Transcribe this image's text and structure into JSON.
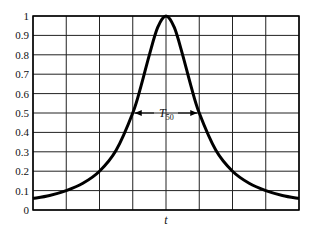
{
  "chart_data": {
    "type": "line",
    "title": "",
    "xlabel": "t",
    "ylabel": "",
    "xlim": [
      -4,
      4
    ],
    "ylim": [
      0,
      1
    ],
    "x_grid_divisions": 8,
    "yticks": [
      0,
      0.1,
      0.2,
      0.3,
      0.4,
      0.5,
      0.6,
      0.7,
      0.8,
      0.9,
      1
    ],
    "ytick_labels": [
      "0",
      "0.1",
      "0.2",
      "0.3",
      "0.4",
      "0.5",
      "0.6",
      "0.7",
      "0.8",
      "0.9",
      "1"
    ],
    "xtick_labels": [],
    "grid": true,
    "series": [
      {
        "name": "response",
        "x": [
          -4,
          -3.5,
          -3,
          -2.5,
          -2,
          -1.5,
          -1,
          -0.75,
          -0.5,
          -0.25,
          0,
          0.25,
          0.5,
          0.75,
          1,
          1.5,
          2,
          2.5,
          3,
          3.5,
          4
        ],
        "y": [
          0.059,
          0.075,
          0.1,
          0.138,
          0.2,
          0.308,
          0.5,
          0.64,
          0.8,
          0.941,
          1.0,
          0.941,
          0.8,
          0.64,
          0.5,
          0.308,
          0.2,
          0.138,
          0.1,
          0.075,
          0.059
        ]
      }
    ],
    "annotations": [
      {
        "text": "T",
        "subscript": "50",
        "x_from": -1,
        "x_to": 1,
        "y": 0.5,
        "type": "double-arrow"
      }
    ]
  }
}
